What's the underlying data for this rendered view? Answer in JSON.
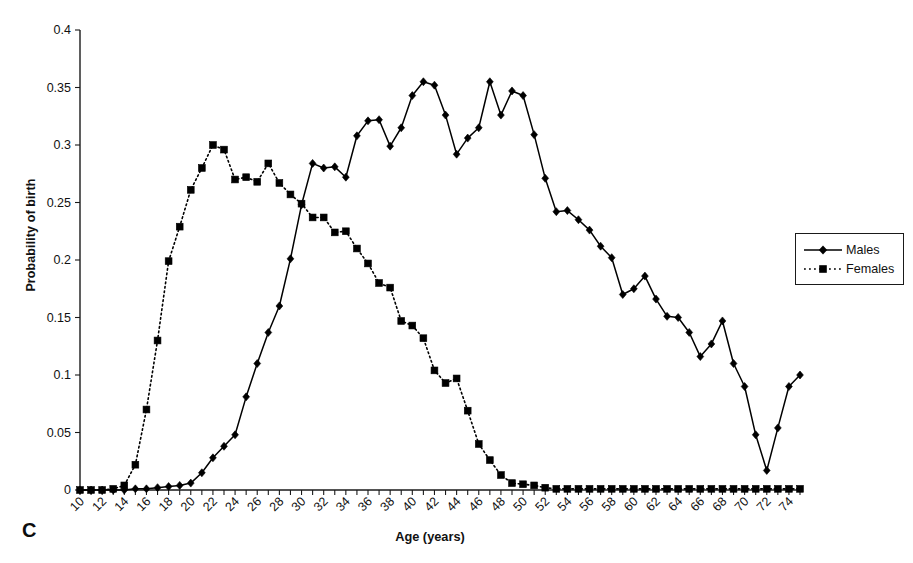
{
  "chart_data": {
    "type": "line",
    "title": "",
    "panel_label": "C",
    "xlabel": "Age (years)",
    "ylabel": "Probability of birth",
    "xlim": [
      10,
      75
    ],
    "ylim": [
      0,
      0.4
    ],
    "ytick_labels": [
      "0",
      "0.05",
      "0.1",
      "0.15",
      "0.2",
      "0.25",
      "0.3",
      "0.35",
      "0.4"
    ],
    "ytick_values": [
      0,
      0.05,
      0.1,
      0.15,
      0.2,
      0.25,
      0.3,
      0.35,
      0.4
    ],
    "xtick_labels": [
      "10",
      "12",
      "14",
      "16",
      "18",
      "20",
      "22",
      "24",
      "26",
      "28",
      "30",
      "32",
      "34",
      "36",
      "38",
      "40",
      "42",
      "44",
      "46",
      "48",
      "50",
      "52",
      "54",
      "56",
      "58",
      "60",
      "62",
      "64",
      "66",
      "68",
      "70",
      "72",
      "74"
    ],
    "xtick_values": [
      10,
      12,
      14,
      16,
      18,
      20,
      22,
      24,
      26,
      28,
      30,
      32,
      34,
      36,
      38,
      40,
      42,
      44,
      46,
      48,
      50,
      52,
      54,
      56,
      58,
      60,
      62,
      64,
      66,
      68,
      70,
      72,
      74
    ],
    "grid": false,
    "legend_position": "right",
    "x": [
      10,
      11,
      12,
      13,
      14,
      15,
      16,
      17,
      18,
      19,
      20,
      21,
      22,
      23,
      24,
      25,
      26,
      27,
      28,
      29,
      30,
      31,
      32,
      33,
      34,
      35,
      36,
      37,
      38,
      39,
      40,
      41,
      42,
      43,
      44,
      45,
      46,
      47,
      48,
      49,
      50,
      51,
      52,
      53,
      54,
      55,
      56,
      57,
      58,
      59,
      60,
      61,
      62,
      63,
      64,
      65,
      66,
      67,
      68,
      69,
      70,
      71,
      72,
      73,
      74,
      75
    ],
    "series": [
      {
        "name": "Males",
        "marker": "diamond",
        "linestyle": "solid",
        "color": "#000000",
        "values": [
          0.0,
          0.0,
          0.0,
          0.0,
          0.0,
          0.001,
          0.001,
          0.002,
          0.003,
          0.004,
          0.006,
          0.015,
          0.028,
          0.038,
          0.048,
          0.081,
          0.11,
          0.137,
          0.16,
          0.201,
          0.248,
          0.284,
          0.28,
          0.281,
          0.272,
          0.308,
          0.321,
          0.322,
          0.299,
          0.315,
          0.343,
          0.355,
          0.352,
          0.326,
          0.292,
          0.306,
          0.315,
          0.355,
          0.326,
          0.347,
          0.343,
          0.309,
          0.271,
          0.242,
          0.243,
          0.235,
          0.226,
          0.212,
          0.202,
          0.17,
          0.175,
          0.186,
          0.166,
          0.151,
          0.15,
          0.137,
          0.116,
          0.127,
          0.147,
          0.11,
          0.09,
          0.048,
          0.017,
          0.054,
          0.09,
          0.1
        ]
      },
      {
        "name": "Females",
        "marker": "square",
        "linestyle": "dotted",
        "color": "#000000",
        "values": [
          0.0,
          0.0,
          0.0,
          0.001,
          0.004,
          0.022,
          0.07,
          0.13,
          0.199,
          0.229,
          0.261,
          0.28,
          0.3,
          0.296,
          0.27,
          0.272,
          0.268,
          0.284,
          0.267,
          0.257,
          0.249,
          0.237,
          0.237,
          0.224,
          0.225,
          0.21,
          0.197,
          0.18,
          0.176,
          0.147,
          0.143,
          0.132,
          0.104,
          0.093,
          0.097,
          0.069,
          0.04,
          0.026,
          0.013,
          0.006,
          0.005,
          0.004,
          0.002,
          0.001,
          0.001,
          0.001,
          0.001,
          0.001,
          0.001,
          0.001,
          0.001,
          0.001,
          0.001,
          0.001,
          0.001,
          0.001,
          0.001,
          0.001,
          0.001,
          0.001,
          0.001,
          0.001,
          0.001,
          0.001,
          0.001,
          0.001
        ]
      }
    ]
  },
  "legend": {
    "items": [
      {
        "label": "Males"
      },
      {
        "label": "Females"
      }
    ]
  }
}
